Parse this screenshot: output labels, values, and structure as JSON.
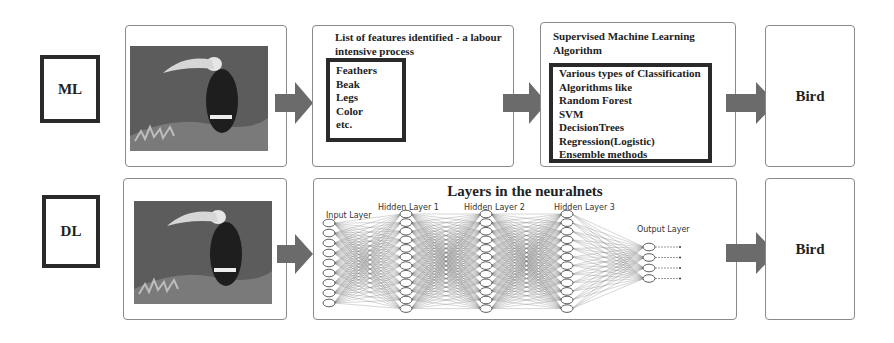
{
  "rows": {
    "ml": {
      "label": "ML",
      "image_alt": "toucan-photo",
      "features_panel": {
        "heading": "List of features identified - a labour intensive process",
        "items": [
          "Feathers",
          "Beak",
          "Legs",
          "Color",
          "etc."
        ]
      },
      "algorithm_panel": {
        "heading": "Supervised Machine Learning Algorithm",
        "items": [
          "Various types of Classification",
          "Algorithms like",
          "Random Forest",
          "SVM",
          "DecisionTrees",
          "Regression(Logistic)",
          "Ensemble methods"
        ]
      },
      "output": "Bird"
    },
    "dl": {
      "label": "DL",
      "image_alt": "toucan-photo",
      "network_panel": {
        "title": "Layers in the neuralnets",
        "layers": [
          {
            "label": "Input Layer",
            "nodes": 9
          },
          {
            "label": "Hidden Layer 1",
            "nodes": 12
          },
          {
            "label": "Hidden Layer 2",
            "nodes": 12
          },
          {
            "label": "Hidden Layer 3",
            "nodes": 12
          },
          {
            "label": "Output Layer",
            "nodes": 4
          }
        ]
      },
      "output": "Bird"
    }
  },
  "colors": {
    "arrow": "#6b6b6b",
    "panel_border": "#8a8a8a",
    "box_border": "#2a2a2a"
  }
}
